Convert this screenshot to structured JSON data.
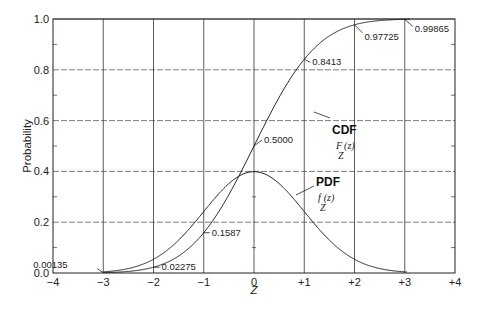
{
  "chart_data": {
    "type": "line",
    "title": "",
    "xlabel": "Z",
    "ylabel": "Probability",
    "xlim": [
      -4,
      4
    ],
    "ylim": [
      0,
      1.0
    ],
    "grid": true,
    "x_ticks": [
      "-4",
      "-3",
      "-2",
      "-1",
      "0",
      "+1",
      "+2",
      "+3",
      "+4"
    ],
    "y_ticks": [
      "0.0",
      "0.2",
      "0.4",
      "0.6",
      "0.8",
      "1.0"
    ],
    "series": [
      {
        "name": "CDF",
        "function_label": "F_Z(z)",
        "kind": "normal_cdf"
      },
      {
        "name": "PDF",
        "function_label": "f_Z(z)",
        "kind": "normal_pdf"
      }
    ],
    "annotations": [
      {
        "text": "0.00135",
        "x": -3,
        "y": 0.00135
      },
      {
        "text": "0.02275",
        "x": -2,
        "y": 0.02275
      },
      {
        "text": "0.1587",
        "x": -1,
        "y": 0.1587
      },
      {
        "text": "0.5000",
        "x": 0,
        "y": 0.5
      },
      {
        "text": "0.8413",
        "x": 1,
        "y": 0.8413
      },
      {
        "text": "0.97725",
        "x": 2,
        "y": 0.97725
      },
      {
        "text": "0.99865",
        "x": 3,
        "y": 0.99865
      }
    ],
    "legend": {
      "cdf_label": "CDF",
      "cdf_fn_main": "F",
      "cdf_fn_sub": "Z",
      "cdf_fn_arg": "(z)",
      "pdf_label": "PDF",
      "pdf_fn_main": "f",
      "pdf_fn_sub": "Z",
      "pdf_fn_arg": "(z)"
    }
  }
}
